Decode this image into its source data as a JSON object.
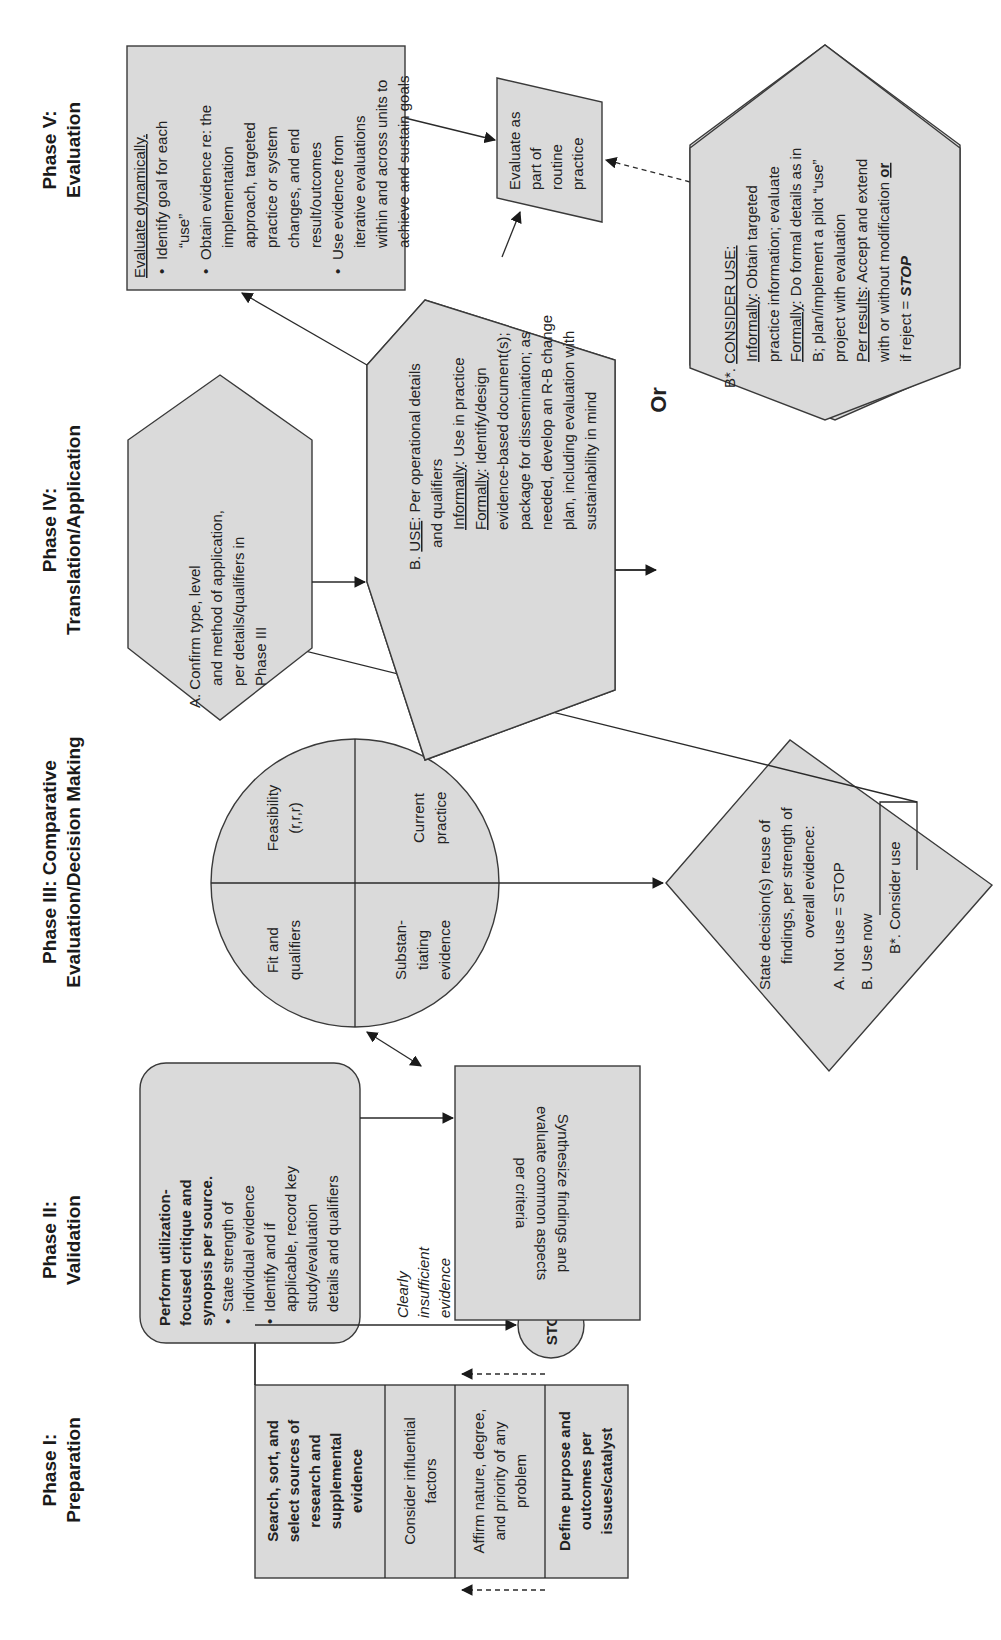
{
  "figure": {
    "orientation": "rotated 90 degrees counter-clockwise",
    "phases": [
      {
        "id": "phase1",
        "line1": "Phase I:",
        "line2": "Preparation"
      },
      {
        "id": "phase2",
        "line1": "Phase II:",
        "line2": "Validation"
      },
      {
        "id": "phase3",
        "line1": "Phase III: Comparative",
        "line2": "Evaluation/Decision Making"
      },
      {
        "id": "phase4",
        "line1": "Phase IV:",
        "line2": "Translation/Application"
      },
      {
        "id": "phase5",
        "line1": "Phase V:",
        "line2": "Evaluation"
      }
    ],
    "preparation_steps": [
      {
        "lines": [
          "Search, sort, and",
          "select sources of",
          "research and",
          "supplemental",
          "evidence"
        ],
        "bold": true
      },
      {
        "lines": [
          "Consider influential",
          "factors"
        ],
        "bold": false
      },
      {
        "lines": [
          "Affirm nature, degree,",
          "and priority of any",
          "problem"
        ],
        "bold": false
      },
      {
        "lines": [
          "Define purpose and",
          "outcomes per",
          "issues/catalyst"
        ],
        "bold": true
      }
    ],
    "validation_box": {
      "title_lines": [
        "Perform utilization-",
        "focused critique and",
        "synopsis per source."
      ],
      "bullets": [
        {
          "lines": [
            "State strength of",
            "individual evidence"
          ]
        },
        {
          "lines": [
            "Identify and if",
            "applicable, record key",
            "study/evaluation",
            "details and qualifiers"
          ]
        }
      ]
    },
    "insufficient_label": [
      "Clearly",
      "insufficient",
      "evidence"
    ],
    "stop_circle": "STOP",
    "synthesize_box": [
      "Synthesize findings and",
      "evaluate common aspects",
      "per criteria"
    ],
    "criteria_circle": {
      "quadrants": [
        {
          "id": "feasibility",
          "lines": [
            "Feasibility",
            "(r,r,r)"
          ]
        },
        {
          "id": "current-practice",
          "lines": [
            "Current",
            "practice"
          ]
        },
        {
          "id": "fit",
          "lines": [
            "Fit and",
            "qualifiers"
          ]
        },
        {
          "id": "substantiating",
          "lines": [
            "Substan-",
            "tiating",
            "evidence"
          ]
        }
      ]
    },
    "decision_diamond": {
      "lines": [
        "State decision(s) reuse of",
        "findings, per strength of",
        "overall evidence:"
      ],
      "options": [
        "A. Not use = STOP",
        "B. Use now",
        "B*. Consider use"
      ]
    },
    "hexagon_a": [
      "A. Confirm type, level",
      "and method of application,",
      "per details/qualifiers in",
      "Phase III"
    ],
    "hexagon_b": {
      "heading_label": "USE",
      "heading_prefix": "B. ",
      "heading_rest": ":  Per operational details",
      "line2": "and qualifiers",
      "informally_label": "Informally",
      "informally_text": ":  Use in practice",
      "formally_label": "Formally",
      "formally_text": ":  Identify/design",
      "formally_lines": [
        "evidence-based document(s);",
        "package for dissemination; as",
        "needed, develop an R-B change",
        "plan, including evaluation with",
        "sustainability in mind"
      ]
    },
    "or_label": "Or",
    "evaluate_box": {
      "heading": "Evaluate dynamically.",
      "bullets": [
        {
          "lines": [
            "Identify goal for each",
            "“use”"
          ]
        },
        {
          "lines": [
            "Obtain evidence re: the",
            "implementation",
            "approach, targeted",
            "practice or system",
            "changes, and end",
            "result/outcomes"
          ]
        },
        {
          "lines": [
            "Use evidence from",
            "iterative evaluations",
            "within and across units to",
            "achieve and sustain goals"
          ]
        }
      ]
    },
    "routine_box": [
      "Evaluate as",
      "part of",
      "routine",
      "practice"
    ],
    "hexagon_bstar": {
      "heading_prefix": "B*. ",
      "heading_label": "CONSIDER USE:",
      "informally_label": "Informally",
      "informally_text": ":  Obtain targeted",
      "line3": "practice information; evaluate",
      "formally_label": "Formally",
      "formally_text": ":  Do formal details as in",
      "line5": "B; plan/implement a pilot “use”",
      "line6": "project with evaluation",
      "results_label": "Per results",
      "results_text": ":  Accept and extend",
      "line8_text": "with or without modification ",
      "line8_or": "or",
      "line9_text": "if reject = ",
      "line9_stop": "STOP"
    },
    "colors": {
      "shape_fill": "#dadada",
      "stroke": "#3a3a3a",
      "background": "#ffffff",
      "text": "#222222"
    }
  }
}
